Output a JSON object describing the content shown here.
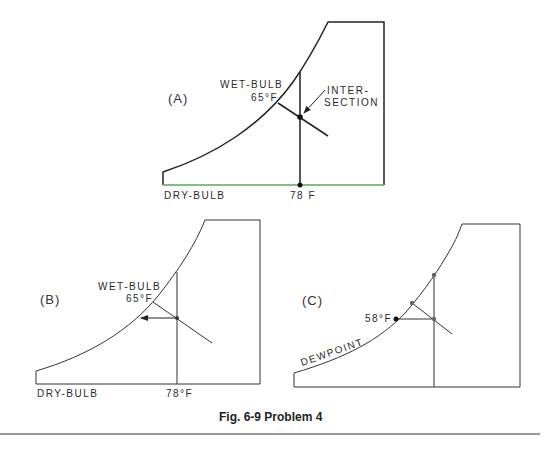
{
  "figure": {
    "caption": "Fig. 6-9  Problem 4",
    "colors": {
      "ink": "#222222",
      "dry_bulb_line_A": "#5aa75a",
      "background": "#ffffff"
    }
  },
  "panels": {
    "A": {
      "label": "(A)",
      "wet_bulb_label": "WET-BULB",
      "wet_bulb_value": "65°F",
      "intersection_label_line1": "INTER-",
      "intersection_label_line2": "SECTION",
      "dry_bulb_label": "DRY-BULB",
      "dry_bulb_value": "78 F"
    },
    "B": {
      "label": "(B)",
      "wet_bulb_label": "WET-BULB",
      "wet_bulb_value": "65°F",
      "dry_bulb_label": "DRY-BULB",
      "dry_bulb_value": "78°F"
    },
    "C": {
      "label": "(C)",
      "dewpoint_value": "58°F",
      "dewpoint_label": "DEWPOINT"
    }
  }
}
